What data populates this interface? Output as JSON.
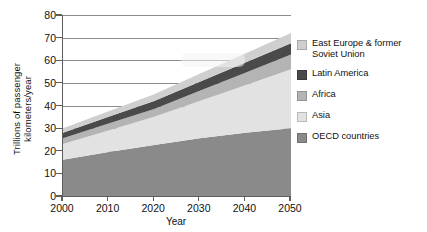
{
  "chart_data": {
    "type": "area",
    "title": "",
    "xlabel": "Year",
    "ylabel": "Trillions of passenger\nkilometers/year",
    "xlim": [
      2000,
      2050
    ],
    "ylim": [
      0,
      80
    ],
    "yticks": [
      0,
      10,
      20,
      30,
      40,
      50,
      60,
      70,
      80
    ],
    "xticks": [
      2000,
      2010,
      2020,
      2030,
      2040,
      2050
    ],
    "grid": true,
    "stacked": true,
    "legend_position": "right",
    "x": [
      2000,
      2010,
      2020,
      2030,
      2040,
      2050
    ],
    "series": [
      {
        "name": "OECD countries",
        "color": "#8a8a8a",
        "values": [
          16.0,
          19.5,
          22.5,
          25.5,
          28.0,
          30.0
        ]
      },
      {
        "name": "Asia",
        "color": "#e2e2e2",
        "values": [
          7.0,
          9.5,
          12.5,
          16.5,
          21.0,
          26.0
        ]
      },
      {
        "name": "Africa",
        "color": "#b4b4b4",
        "values": [
          2.5,
          3.0,
          3.5,
          4.5,
          5.5,
          6.5
        ]
      },
      {
        "name": "Latin America",
        "color": "#4a4a4a",
        "values": [
          2.5,
          3.0,
          3.5,
          4.0,
          4.5,
          5.0
        ]
      },
      {
        "name": "East Europe & former Soviet Union",
        "color": "#cfcfcf",
        "values": [
          2.0,
          2.5,
          3.0,
          3.5,
          4.0,
          4.5
        ]
      }
    ],
    "totals": [
      30.0,
      37.5,
      45.0,
      54.0,
      63.0,
      72.0
    ]
  },
  "axes": {
    "ytick_labels": [
      "80",
      "70",
      "60",
      "50",
      "40",
      "30",
      "20",
      "10",
      "0"
    ],
    "xtick_labels": [
      "2000",
      "2010",
      "2020",
      "2030",
      "2040",
      "2050"
    ],
    "x_title": "Year",
    "y_title": "Trillions of passenger\nkilometers/year"
  },
  "legend": {
    "items": [
      {
        "label": "East Europe & former\nSoviet Union",
        "color": "#cfcfcf"
      },
      {
        "label": "Latin America",
        "color": "#4a4a4a"
      },
      {
        "label": "Africa",
        "color": "#b4b4b4"
      },
      {
        "label": "Asia",
        "color": "#e2e2e2"
      },
      {
        "label": "OECD countries",
        "color": "#8a8a8a"
      }
    ]
  }
}
